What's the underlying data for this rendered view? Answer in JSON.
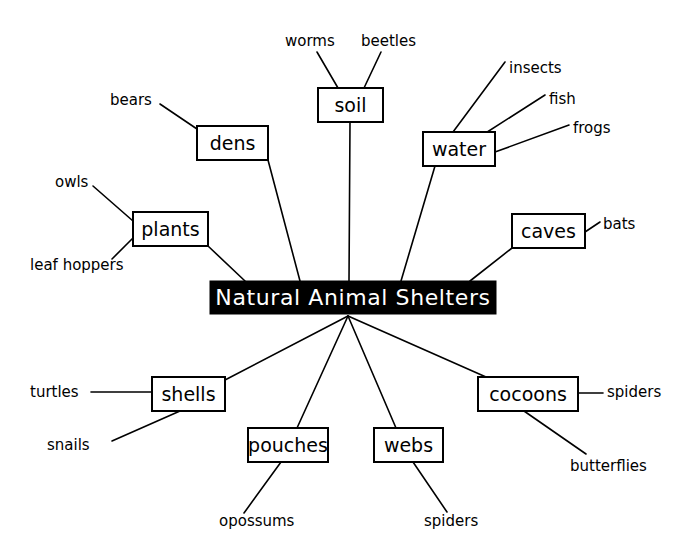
{
  "diagram": {
    "title": "Natural Animal Shelters",
    "type": "mind-map",
    "background_color": "#ffffff",
    "line_color": "#000000",
    "hub": {
      "label": "Natural Animal Shelters",
      "fill": "#000000",
      "text_color": "#ffffff",
      "x": 210,
      "y": 281,
      "w": 286,
      "h": 33
    },
    "nodes": [
      {
        "id": "dens",
        "label": "dens",
        "x": 197,
        "y": 126,
        "w": 71,
        "h": 34,
        "hub_anchor": {
          "x": 268,
          "y": 160
        },
        "hub_point": {
          "x": 300,
          "y": 281
        },
        "leaves": [
          {
            "label": "bears",
            "text_x": 110,
            "text_y": 100,
            "anchor": "start",
            "line_from": {
              "x": 197,
              "y": 129
            },
            "line_to": {
              "x": 160,
              "y": 104
            }
          }
        ]
      },
      {
        "id": "soil",
        "label": "soil",
        "x": 318,
        "y": 88,
        "w": 65,
        "h": 34,
        "hub_anchor": {
          "x": 350,
          "y": 122
        },
        "hub_point": {
          "x": 349,
          "y": 281
        },
        "leaves": [
          {
            "label": "worms",
            "text_x": 285,
            "text_y": 41,
            "anchor": "start",
            "line_from": {
              "x": 338,
              "y": 88
            },
            "line_to": {
              "x": 317,
              "y": 52
            }
          },
          {
            "label": "beetles",
            "text_x": 361,
            "text_y": 41,
            "anchor": "start",
            "line_from": {
              "x": 364,
              "y": 88
            },
            "line_to": {
              "x": 381,
              "y": 52
            }
          }
        ]
      },
      {
        "id": "water",
        "label": "water",
        "x": 423,
        "y": 132,
        "w": 72,
        "h": 34,
        "hub_anchor": {
          "x": 435,
          "y": 166
        },
        "hub_point": {
          "x": 401,
          "y": 281
        },
        "leaves": [
          {
            "label": "insects",
            "text_x": 509,
            "text_y": 68,
            "anchor": "start",
            "line_from": {
              "x": 453,
              "y": 132
            },
            "line_to": {
              "x": 505,
              "y": 62
            }
          },
          {
            "label": "fish",
            "text_x": 549,
            "text_y": 99,
            "anchor": "start",
            "line_from": {
              "x": 481,
              "y": 136
            },
            "line_to": {
              "x": 545,
              "y": 95
            }
          },
          {
            "label": "frogs",
            "text_x": 573,
            "text_y": 128,
            "anchor": "start",
            "line_from": {
              "x": 495,
              "y": 152
            },
            "line_to": {
              "x": 569,
              "y": 125
            }
          }
        ]
      },
      {
        "id": "plants",
        "label": "plants",
        "x": 133,
        "y": 212,
        "w": 75,
        "h": 34,
        "hub_anchor": {
          "x": 208,
          "y": 246
        },
        "hub_point": {
          "x": 245,
          "y": 281
        },
        "leaves": [
          {
            "label": "owls",
            "text_x": 55,
            "text_y": 182,
            "anchor": "start",
            "line_from": {
              "x": 133,
              "y": 221
            },
            "line_to": {
              "x": 93,
              "y": 186
            }
          },
          {
            "label": "leaf hoppers",
            "text_x": 30,
            "text_y": 265,
            "anchor": "start",
            "line_from": {
              "x": 133,
              "y": 238
            },
            "line_to": {
              "x": 112,
              "y": 259
            }
          }
        ]
      },
      {
        "id": "caves",
        "label": "caves",
        "x": 512,
        "y": 214,
        "w": 73,
        "h": 34,
        "hub_anchor": {
          "x": 512,
          "y": 248
        },
        "hub_point": {
          "x": 470,
          "y": 281
        },
        "leaves": [
          {
            "label": "bats",
            "text_x": 603,
            "text_y": 224,
            "anchor": "start",
            "line_from": {
              "x": 585,
              "y": 232
            },
            "line_to": {
              "x": 600,
              "y": 222
            }
          }
        ]
      },
      {
        "id": "shells",
        "label": "shells",
        "x": 152,
        "y": 377,
        "w": 73,
        "h": 34,
        "hub_anchor": {
          "x": 225,
          "y": 380
        },
        "hub_point": {
          "x": 348,
          "y": 316
        },
        "leaves": [
          {
            "label": "turtles",
            "text_x": 30,
            "text_y": 392,
            "anchor": "start",
            "line_from": {
              "x": 152,
              "y": 392
            },
            "line_to": {
              "x": 91,
              "y": 392
            }
          },
          {
            "label": "snails",
            "text_x": 47,
            "text_y": 445,
            "anchor": "start",
            "line_from": {
              "x": 180,
              "y": 411
            },
            "line_to": {
              "x": 112,
              "y": 441
            }
          }
        ]
      },
      {
        "id": "pouches",
        "label": "pouches",
        "x": 248,
        "y": 428,
        "w": 80,
        "h": 34,
        "hub_anchor": {
          "x": 297,
          "y": 428
        },
        "hub_point": {
          "x": 348,
          "y": 316
        },
        "leaves": [
          {
            "label": "opossums",
            "text_x": 219,
            "text_y": 521,
            "anchor": "start",
            "line_from": {
              "x": 281,
              "y": 462
            },
            "line_to": {
              "x": 244,
              "y": 513
            }
          }
        ]
      },
      {
        "id": "webs",
        "label": "webs",
        "x": 374,
        "y": 428,
        "w": 69,
        "h": 34,
        "hub_anchor": {
          "x": 396,
          "y": 428
        },
        "hub_point": {
          "x": 348,
          "y": 316
        },
        "leaves": [
          {
            "label": "spiders",
            "text_x": 424,
            "text_y": 521,
            "anchor": "start",
            "line_from": {
              "x": 413,
              "y": 462
            },
            "line_to": {
              "x": 447,
              "y": 512
            }
          }
        ]
      },
      {
        "id": "cocoons",
        "label": "cocoons",
        "x": 478,
        "y": 377,
        "w": 100,
        "h": 34,
        "hub_anchor": {
          "x": 486,
          "y": 377
        },
        "hub_point": {
          "x": 348,
          "y": 316
        },
        "leaves": [
          {
            "label": "spiders",
            "text_x": 607,
            "text_y": 392,
            "anchor": "start",
            "line_from": {
              "x": 578,
              "y": 393
            },
            "line_to": {
              "x": 603,
              "y": 393
            }
          },
          {
            "label": "butterflies",
            "text_x": 570,
            "text_y": 466,
            "anchor": "start",
            "line_from": {
              "x": 524,
              "y": 411
            },
            "line_to": {
              "x": 586,
              "y": 454
            }
          }
        ]
      }
    ]
  }
}
